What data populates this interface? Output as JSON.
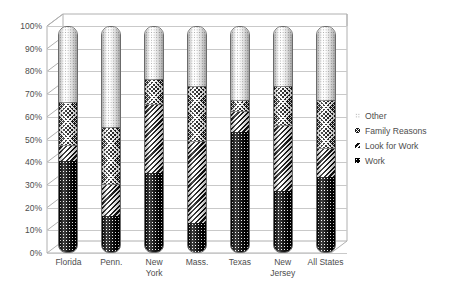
{
  "chart_data": {
    "type": "bar",
    "subtype": "stacked-percent-3d-cylinder",
    "title": "",
    "xlabel": "",
    "ylabel": "",
    "ylim": [
      0,
      100
    ],
    "ytick_labels": [
      "100%",
      "90%",
      "80%",
      "70%",
      "60%",
      "50%",
      "40%",
      "30%",
      "20%",
      "10%",
      "0%"
    ],
    "ytick_values": [
      100,
      90,
      80,
      70,
      60,
      50,
      40,
      30,
      20,
      10,
      0
    ],
    "grid": true,
    "legend_position": "right",
    "categories": [
      "Florida",
      "Penn.",
      "New\nYork",
      "Mass.",
      "Texas",
      "New\nJersey",
      "All States"
    ],
    "series": [
      {
        "name": "Work",
        "pattern": "dark-dotted",
        "values": [
          40,
          16,
          35,
          13,
          53,
          27,
          33
        ]
      },
      {
        "name": "Look for Work",
        "pattern": "diagonal-stripes",
        "values": [
          7,
          14,
          30,
          36,
          9,
          29,
          13
        ]
      },
      {
        "name": "Family Reasons",
        "pattern": "checkered",
        "values": [
          19,
          25,
          11,
          24,
          5,
          17,
          21
        ]
      },
      {
        "name": "Other",
        "pattern": "light-dotted",
        "values": [
          34,
          45,
          24,
          27,
          33,
          27,
          33
        ]
      }
    ],
    "legend_entries": [
      {
        "label": "Other",
        "pattern": "light-dotted"
      },
      {
        "label": "Family Reasons",
        "pattern": "checkered"
      },
      {
        "label": "Look for Work",
        "pattern": "diagonal-stripes"
      },
      {
        "label": "Work",
        "pattern": "dark-dotted"
      }
    ],
    "colors": {
      "work": "#000000",
      "look_for_work": "#111111",
      "family_reasons": "#1a1a1a",
      "other": "#fdfdfd",
      "gridline": "#c9c9c9",
      "text": "#4d4d4d",
      "frame": "#b0b0b0"
    }
  }
}
